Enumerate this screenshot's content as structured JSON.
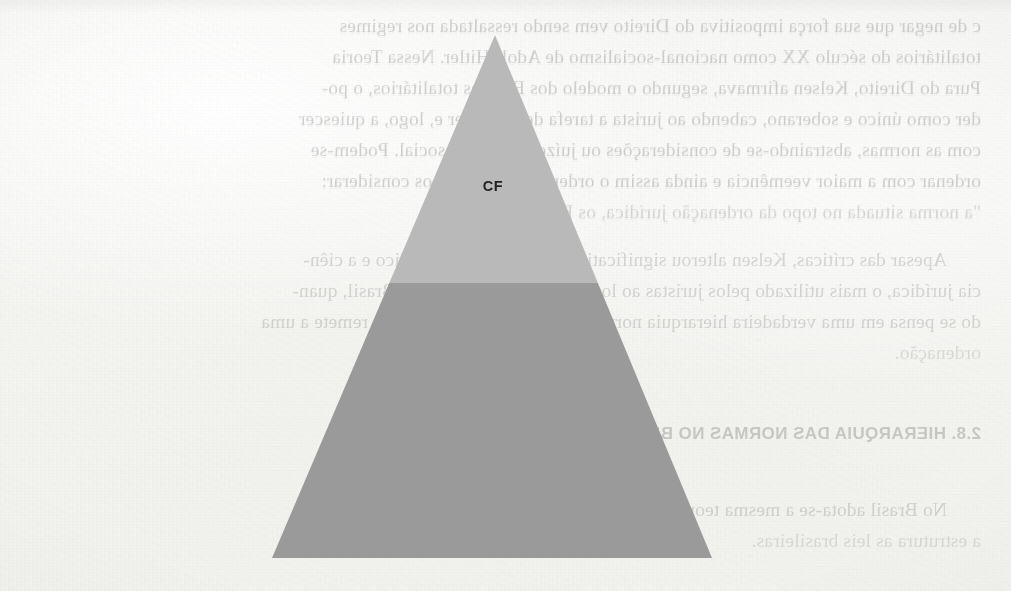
{
  "page": {
    "kind": "scanned-book-page",
    "paper_color": "#f4f4f2",
    "width": 1011,
    "height": 591
  },
  "diagram": {
    "name": "hierarchy-pyramid",
    "shape": "triangle",
    "apex_label": "CF",
    "upper_band_color": "#b9b9b9",
    "lower_band_color": "#9a9a9a",
    "apex_x": 495,
    "apex_y": 35,
    "base_left_x": 272,
    "base_right_x": 712,
    "base_y": 558,
    "band_split_y": 283
  },
  "show_through_text": {
    "note": "Text bled through from the reverse side of the sheet; renders mirrored.",
    "body_top": [
      "c de negar que sua força impositiva do Direito vem sendo ressaltada nos regimes",
      "totalitários do século XX como nacional-socialismo de Adolf Hitler. Nessa Teoria",
      "Pura do Direito, Kelsen afirmava, segundo o modelo dos Estados totalitários, o po-",
      "der como único e soberano, cabendo ao jurista a tarefa de conhecer e, logo, a quiescer",
      "com as normas, abstraindo-se de considerações ou juízos de índole social. Podem-se",
      "ordenar com a maior veemência e ainda assim o ordenamento podemos considerar:",
      "\"a norma situada no topo da ordenação jurídica, os Estados\"."
    ],
    "body_middle": [
      "Apesar das críticas, Kelsen alterou significativamente o sentido jurídico e a ciên-",
      "cia jurídica, o mais utilizado pelos juristas ao longo do último século. No Brasil, quan-",
      "do se pensa em uma verdadeira hierarquia normativa estruturada, logo ele se remete a uma",
      "ordenação."
    ],
    "heading": "2.8. HIERARQUIA DAS NORMAS NO BRASIL",
    "body_bottom": [
      "No Brasil adota-se a mesma teoria kelseniana de pirâmide. Cabe a hierarquia que",
      "a estrutura as leis brasileiras."
    ]
  }
}
